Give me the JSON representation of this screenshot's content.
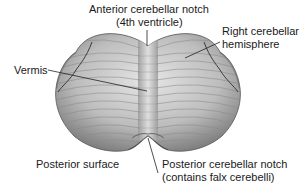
{
  "figure": {
    "labels": {
      "anterior_notch_line1": "Anterior cerebellar notch",
      "anterior_notch_line2": "(4th ventricle)",
      "right_hemisphere_line1": "Right cerebellar",
      "right_hemisphere_line2": "hemisphere",
      "vermis": "Vermis",
      "posterior_surface": "Posterior surface",
      "posterior_notch_line1": "Posterior cerebellar notch",
      "posterior_notch_line2": "(contains falx cerebelli)"
    },
    "colors": {
      "background": "#ffffff",
      "text": "#1a1a1a",
      "tissue_light": "#d9d9d9",
      "tissue_mid": "#a8a8a8",
      "tissue_dark": "#5a5a5a",
      "leader_line": "#222222"
    }
  }
}
